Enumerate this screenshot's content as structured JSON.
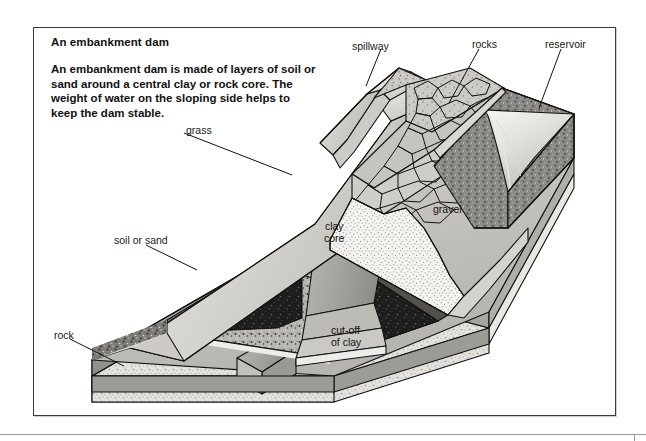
{
  "figure": {
    "title": "An embankment dam",
    "description": "An embankment dam is made of layers of soil or sand around a central clay or rock core. The weight of water on the sloping side helps to keep the dam stable.",
    "type": "cutaway-isometric-diagram"
  },
  "labels": {
    "spillway": "spillway",
    "rocks": "rocks",
    "reservoir": "reservoir",
    "grass": "grass",
    "soil_or_sand": "soil or sand",
    "rock": "rock",
    "gravel": "gravel",
    "clay_core_line1": "clay",
    "clay_core_line2": "core",
    "cutoff_line1": "cut-off",
    "cutoff_line2": "of clay"
  },
  "colors": {
    "ink": "#1a1a1a",
    "frame": "#3a3a3a",
    "page": "#ffffff",
    "grass_face": "#d4d2cc",
    "grass_top": "#e6e4df",
    "clay_core": "#a9a9a4",
    "gravel": "#f2f1ee",
    "soil_dark": "#232323",
    "soil_mid": "#6f6d68",
    "rock_base": "#dedcd6",
    "water": "#eeeeea",
    "rockfill": "#c9c7c1"
  }
}
